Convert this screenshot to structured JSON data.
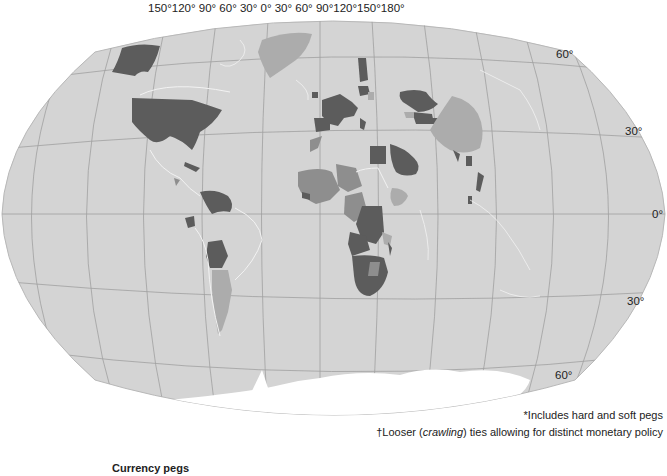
{
  "map": {
    "title": "Currency pegs",
    "projection": "Winkel tripel (world)",
    "longitude_labels": "150°120° 90°  60°  30°   0°   30°  60°  90°120°150°180°",
    "latitude_labels": {
      "n60": "60°",
      "n30": "30°",
      "eq": "0°",
      "s30": "30°",
      "s60": "60°"
    },
    "notes": {
      "note1": "*Includes hard and soft pegs",
      "note2_prefix": "†Looser (",
      "note2_italic": "crawling",
      "note2_suffix": ") ties allowing for distinct monetary policy"
    },
    "colors": {
      "ocean": "#d4d4d4",
      "graticule": "#a0a0a0",
      "coastline": "#f2f2f2",
      "pegged_dark": "#5c5c5c",
      "crawling_medium": "#8e8e8e",
      "other_light": "#acacac",
      "antarctica": "#ffffff"
    },
    "categories": [
      {
        "name": "Pegged*",
        "shade": "dark",
        "examples": [
          "United States",
          "Alaska",
          "Eurozone",
          "Saudi Arabia",
          "Kazakhstan",
          "Venezuela",
          "Bolivia",
          "Ecuador",
          "DR Congo",
          "Southern Africa",
          "Egypt"
        ]
      },
      {
        "name": "Crawling†",
        "shade": "medium",
        "examples": [
          "West/Central Africa",
          "Niger",
          "Chad"
        ]
      },
      {
        "name": "Other",
        "shade": "light",
        "examples": [
          "China",
          "Greenland",
          "Argentina",
          "Ethiopia"
        ]
      }
    ]
  }
}
